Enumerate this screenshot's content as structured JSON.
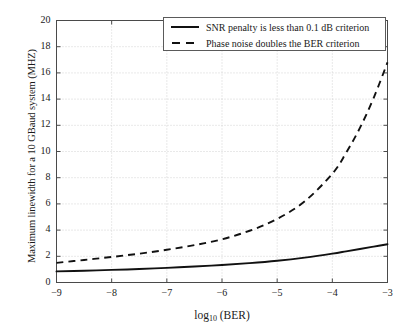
{
  "chart_data": {
    "type": "line",
    "title": "",
    "xlabel": "log10 (BER)",
    "xlabel_base": "log",
    "xlabel_sub": "10",
    "xlabel_rest": " (BER)",
    "ylabel": "Maximum linewidth for a 10 GBaud system (MHZ)",
    "xlim": [
      -9,
      -3
    ],
    "ylim": [
      0,
      20
    ],
    "grid": true,
    "grid_style": "dotted",
    "legend_position": "top-right-inside",
    "xticks": [
      -9,
      -8,
      -7,
      -6,
      -5,
      -4,
      -3
    ],
    "xtick_labels": [
      "−9",
      "−8",
      "−7",
      "−6",
      "−5",
      "−4",
      "−3"
    ],
    "yticks": [
      0,
      2,
      4,
      6,
      8,
      10,
      12,
      14,
      16,
      18,
      20
    ],
    "ytick_labels": [
      "0",
      "2",
      "4",
      "6",
      "8",
      "10",
      "12",
      "14",
      "16",
      "18",
      "20"
    ],
    "x": [
      -9,
      -8.5,
      -8,
      -7.5,
      -7,
      -6.5,
      -6,
      -5.5,
      -5,
      -4.5,
      -4,
      -3.75,
      -3.5,
      -3.25,
      -3
    ],
    "series": [
      {
        "name": "SNR penalty is less than 0.1 dB criterion",
        "style": "solid",
        "color": "#111111",
        "values": [
          0.85,
          0.9,
          0.96,
          1.03,
          1.12,
          1.22,
          1.34,
          1.48,
          1.66,
          1.9,
          2.2,
          2.38,
          2.56,
          2.74,
          2.92
        ]
      },
      {
        "name": "Phase noise doubles the BER criterion",
        "style": "dashed",
        "color": "#111111",
        "values": [
          1.5,
          1.72,
          1.95,
          2.2,
          2.5,
          2.85,
          3.3,
          3.95,
          4.85,
          6.2,
          8.3,
          9.9,
          11.8,
          14.1,
          16.8
        ]
      }
    ]
  },
  "legend": {
    "items": [
      {
        "label": "SNR penalty is less than 0.1 dB criterion",
        "style": "solid"
      },
      {
        "label": "Phase noise doubles the BER criterion",
        "style": "dashed"
      }
    ]
  }
}
